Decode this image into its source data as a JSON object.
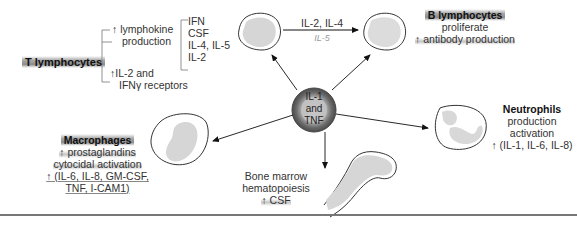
{
  "center": {
    "line1": "IL-1",
    "line2": "and",
    "line3": "TNF"
  },
  "t_lymphocytes": {
    "title": "T lymphocytes",
    "branch1": {
      "arrow": "↑",
      "line1": "lymphokine",
      "line2": "production"
    },
    "cytokines": [
      "IFN",
      "CSF",
      "IL-4, IL-5",
      "IL-2"
    ],
    "branch2": {
      "arrow": "↑",
      "line1": "IL-2 and",
      "line2": "IFNγ receptors"
    }
  },
  "t_to_b_arrow": {
    "label": "IL-2, IL-4",
    "handwritten": "IL-5"
  },
  "b_lymphocytes": {
    "title": "B lymphocytes",
    "line1": "proliferate",
    "line2": "↑ antibody production"
  },
  "macrophages": {
    "title": "Macrophages",
    "line1": "↑ prostaglandins",
    "line2": "cytocidal activation",
    "line3": "↑ (IL-6, IL-8, GM-CSF,",
    "line4": "TNF, I-CAM1)"
  },
  "neutrophils": {
    "title": "Neutrophils",
    "line1": "production",
    "line2": "activation",
    "line3": "↑ (IL-1, IL-6, IL-8)"
  },
  "bone_marrow": {
    "line1": "Bone marrow",
    "line2": "hematopoiesis",
    "line3": "↑ CSF"
  },
  "colors": {
    "highlight": "#8c8c8c",
    "cell_fill": "#d9d9d9",
    "outline": "#333333",
    "center_ring": "#6e6e6e"
  }
}
